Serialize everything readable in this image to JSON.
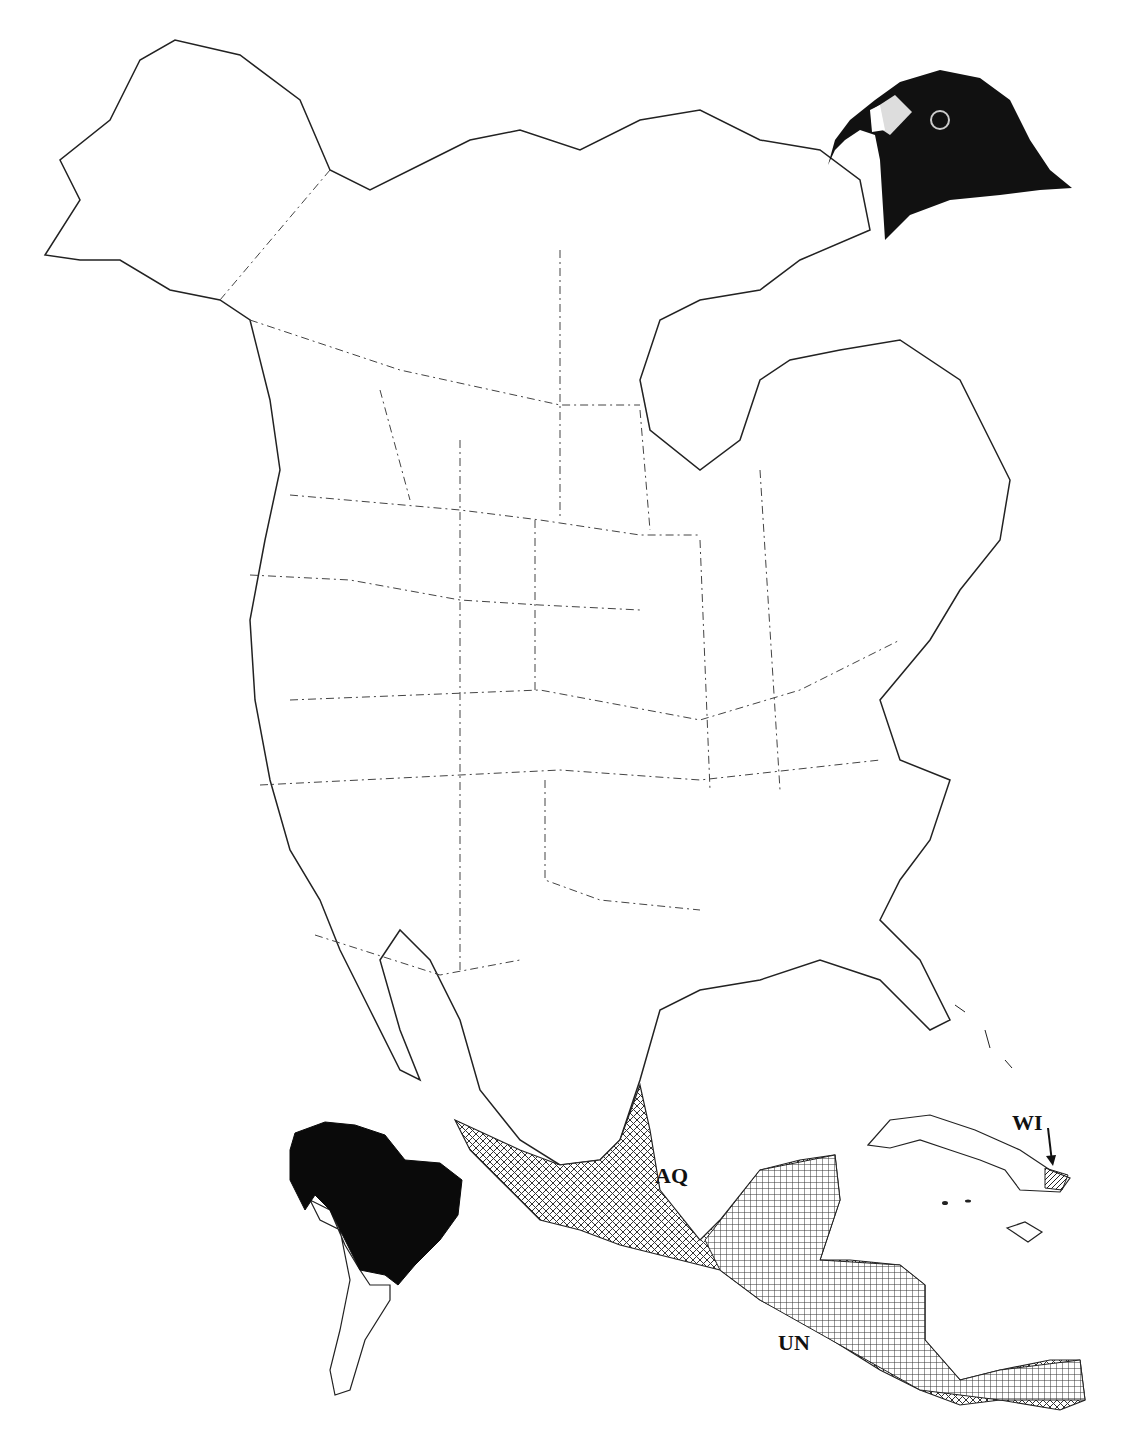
{
  "map": {
    "title": "",
    "region": "North America",
    "colors": {
      "outline": "#222222",
      "range_solid": "#0a0a0a",
      "hatch": "#333333",
      "background": "#ffffff"
    },
    "labels": [
      {
        "id": "AQ",
        "text": "AQ",
        "x": 655,
        "y": 1163
      },
      {
        "id": "UN",
        "text": "UN",
        "x": 778,
        "y": 1330
      },
      {
        "id": "WI",
        "text": "WI",
        "x": 1012,
        "y": 1110
      }
    ],
    "legend_note": "Crosshatched: Mexico & Central America range; solid black: South America range; hatched: eastern Cuba (WI)",
    "illustration": "hawk-head"
  }
}
